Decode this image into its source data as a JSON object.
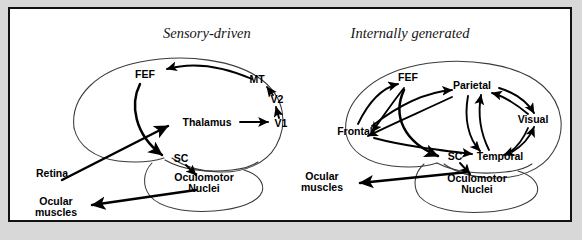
{
  "figure": {
    "background_color": "#d8d8d8",
    "panel_background": "#ffffff",
    "border_color": "#111111",
    "outline_color": "#3a3a3a",
    "arrow_color": "#000000"
  },
  "panels": [
    {
      "id": "sensory-driven",
      "title": "Sensory-driven",
      "nodes": [
        {
          "key": "fef",
          "label": "FEF",
          "x": 145,
          "y": 78
        },
        {
          "key": "mt",
          "label": "MT",
          "x": 257,
          "y": 83
        },
        {
          "key": "v2",
          "label": "V2",
          "x": 277,
          "y": 103
        },
        {
          "key": "v1",
          "label": "V1",
          "x": 281,
          "y": 127
        },
        {
          "key": "thalamus",
          "label": "Thalamus",
          "x": 207,
          "y": 125
        },
        {
          "key": "sc",
          "label": "SC",
          "x": 181,
          "y": 160
        },
        {
          "key": "oculomotor",
          "label": "Oculomotor",
          "x": 204,
          "y": 180
        },
        {
          "key": "nuclei",
          "label": "Nuclei",
          "x": 204,
          "y": 191
        },
        {
          "key": "retina",
          "label": "Retina",
          "x": 36,
          "y": 175
        },
        {
          "key": "ocular",
          "label": "Ocular",
          "x": 56,
          "y": 203
        },
        {
          "key": "muscles",
          "label": "muscles",
          "x": 56,
          "y": 214
        }
      ],
      "connections": [
        {
          "from": "retina",
          "to": "thalamus"
        },
        {
          "from": "thalamus",
          "to": "v1"
        },
        {
          "from": "v1",
          "to": "v2"
        },
        {
          "from": "v2",
          "to": "mt"
        },
        {
          "from": "mt",
          "to": "fef"
        },
        {
          "from": "fef",
          "to": "sc"
        },
        {
          "from": "sc",
          "to": "oculomotor"
        },
        {
          "from": "oculomotor",
          "to": "ocular"
        }
      ]
    },
    {
      "id": "internally-generated",
      "title": "Internally generated",
      "nodes": [
        {
          "key": "fef",
          "label": "FEF",
          "x": 408,
          "y": 81
        },
        {
          "key": "parietal",
          "label": "Parietal",
          "x": 472,
          "y": 88
        },
        {
          "key": "frontal",
          "label": "Frontal",
          "x": 355,
          "y": 133
        },
        {
          "key": "visual",
          "label": "Visual",
          "x": 530,
          "y": 122
        },
        {
          "key": "temporal",
          "label": "Temporal",
          "x": 497,
          "y": 158
        },
        {
          "key": "sc",
          "label": "SC",
          "x": 455,
          "y": 158
        },
        {
          "key": "oculomotor",
          "label": "Oculomotor",
          "x": 477,
          "y": 180
        },
        {
          "key": "nuclei",
          "label": "Nuclei",
          "x": 477,
          "y": 191
        },
        {
          "key": "ocular",
          "label": "Ocular",
          "x": 322,
          "y": 178
        },
        {
          "key": "muscles",
          "label": "muscles",
          "x": 322,
          "y": 189
        }
      ],
      "connections": [
        {
          "from": "frontal",
          "to": "fef"
        },
        {
          "from": "fef",
          "to": "frontal"
        },
        {
          "from": "frontal",
          "to": "parietal"
        },
        {
          "from": "parietal",
          "to": "frontal"
        },
        {
          "from": "parietal",
          "to": "visual"
        },
        {
          "from": "visual",
          "to": "parietal"
        },
        {
          "from": "parietal",
          "to": "temporal"
        },
        {
          "from": "temporal",
          "to": "parietal"
        },
        {
          "from": "visual",
          "to": "temporal"
        },
        {
          "from": "temporal",
          "to": "visual"
        },
        {
          "from": "frontal",
          "to": "temporal"
        },
        {
          "from": "fef",
          "to": "sc"
        },
        {
          "from": "sc",
          "to": "oculomotor"
        },
        {
          "from": "oculomotor",
          "to": "ocular"
        }
      ]
    }
  ]
}
